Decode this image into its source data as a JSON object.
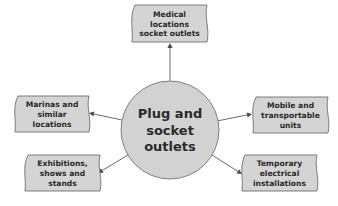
{
  "diagram": {
    "type": "hub-and-spoke",
    "hub": {
      "lines": [
        "Plug and",
        "socket",
        "outlets"
      ],
      "cx": 170,
      "cy": 130,
      "r": 49,
      "fill": "#d2d2d2",
      "stroke": "#808080"
    },
    "nodes": [
      {
        "id": "medical",
        "lines": [
          "Medical",
          "locations",
          "socket outlets"
        ],
        "x": 132,
        "y": 5,
        "w": 75,
        "h": 37,
        "arrow": {
          "x1": 170,
          "y1": 81,
          "x2": 170,
          "y2": 43
        }
      },
      {
        "id": "marinas",
        "lines": [
          "Marinas and",
          "similar",
          "locations"
        ],
        "x": 15,
        "y": 96,
        "w": 74,
        "h": 36,
        "arrow": {
          "x1": 122,
          "y1": 120,
          "x2": 89,
          "y2": 113
        }
      },
      {
        "id": "mobile",
        "lines": [
          "Mobile and",
          "transportable",
          "units"
        ],
        "x": 253,
        "y": 97,
        "w": 75,
        "h": 36,
        "arrow": {
          "x1": 217,
          "y1": 121,
          "x2": 252,
          "y2": 114
        }
      },
      {
        "id": "exhibitions",
        "lines": [
          "Exhibitions,",
          "shows and",
          "stands"
        ],
        "x": 25,
        "y": 155,
        "w": 75,
        "h": 36,
        "arrow": {
          "x1": 128,
          "y1": 155,
          "x2": 98,
          "y2": 173
        }
      },
      {
        "id": "temporary",
        "lines": [
          "Temporary",
          "electrical",
          "installations"
        ],
        "x": 242,
        "y": 155,
        "w": 75,
        "h": 36,
        "arrow": {
          "x1": 212,
          "y1": 155,
          "x2": 242,
          "y2": 174
        }
      }
    ],
    "colors": {
      "box_fill": "#d4d4d4",
      "box_stroke": "#6f6f6f",
      "arrow": "#4a4a4a",
      "text": "#2a2a2a",
      "background": "#ffffff"
    }
  }
}
